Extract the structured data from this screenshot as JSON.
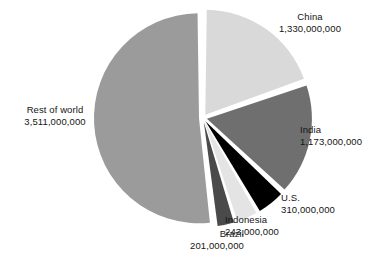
{
  "chart_data": {
    "type": "pie",
    "title": "",
    "subtitle": "",
    "xlabel": "",
    "ylabel": "",
    "legend_position": "none",
    "grid": false,
    "categories": [
      "China",
      "India",
      "U.S.",
      "Indonesia",
      "Brazil",
      "Rest of world"
    ],
    "values": [
      1330000000,
      1173000000,
      310000000,
      243000000,
      201000000,
      3511000000
    ],
    "value_labels": [
      "1,330,000,000",
      "1,173,000,000",
      "310,000,000",
      "243,000,000",
      "201,000,000",
      "3,511,000,000"
    ],
    "colors": [
      "#d9d9d9",
      "#6f6f6f",
      "#000000",
      "#e4e4e4",
      "#4a4a4a",
      "#9b9b9b"
    ],
    "total": 6768000000,
    "exploded": true,
    "slices": [
      {
        "label": "China",
        "value": 1330000000,
        "value_label": "1,330,000,000",
        "color": "#d9d9d9",
        "percent": 19.7
      },
      {
        "label": "India",
        "value": 1173000000,
        "value_label": "1,173,000,000",
        "color": "#6f6f6f",
        "percent": 17.3
      },
      {
        "label": "U.S.",
        "value": 310000000,
        "value_label": "310,000,000",
        "color": "#000000",
        "percent": 4.6
      },
      {
        "label": "Indonesia",
        "value": 243000000,
        "value_label": "243,000,000",
        "color": "#e4e4e4",
        "percent": 3.6
      },
      {
        "label": "Brazil",
        "value": 201000000,
        "value_label": "201,000,000",
        "color": "#4a4a4a",
        "percent": 3.0
      },
      {
        "label": "Rest of world",
        "value": 3511000000,
        "value_label": "3,511,000,000",
        "color": "#9b9b9b",
        "percent": 51.9
      }
    ]
  },
  "labels": {
    "china": {
      "name": "China",
      "value": "1,330,000,000"
    },
    "india": {
      "name": "India",
      "value": "1,173,000,000"
    },
    "us": {
      "name": "U.S.",
      "value": "310,000,000"
    },
    "indonesia": {
      "name": "Indonesia",
      "value": "243,000,000"
    },
    "brazil": {
      "name": "Brazil",
      "value": "201,000,000"
    },
    "rest_of_world": {
      "name": "Rest of world",
      "value": "3,511,000,000"
    }
  },
  "colors": {
    "background": "#ffffff",
    "text": "#141414",
    "china": "#d9d9d9",
    "india": "#6f6f6f",
    "us": "#000000",
    "indonesia": "#e4e4e4",
    "brazil": "#4a4a4a",
    "rest_of_world": "#9b9b9b"
  }
}
